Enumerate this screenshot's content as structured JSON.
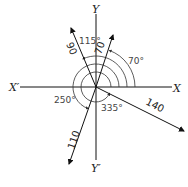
{
  "diagram": {
    "type": "vector-diagram",
    "axes": {
      "x_positive": "X",
      "x_negative": "X′",
      "y_positive": "Y",
      "y_negative": "Y′"
    },
    "vectors": [
      {
        "magnitude": "70",
        "angle": "70°"
      },
      {
        "magnitude": "90",
        "angle": "115°"
      },
      {
        "magnitude": "110",
        "angle": "250°"
      },
      {
        "magnitude": "140",
        "angle": "335°"
      }
    ]
  }
}
